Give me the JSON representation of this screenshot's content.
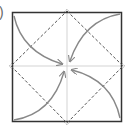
{
  "diagram": {
    "type": "origami-fold",
    "step_mark": ")",
    "colors": {
      "square": "#333333",
      "dashed": "#555555",
      "crease": "#bbbbbb",
      "arrow": "#888888"
    },
    "elements": [
      {
        "kind": "square",
        "label": "paper square"
      },
      {
        "kind": "valley-fold-diamond",
        "label": "dashed diamond connecting side midpoints"
      },
      {
        "kind": "crease",
        "label": "horizontal center crease"
      },
      {
        "kind": "crease",
        "label": "vertical center crease"
      },
      {
        "kind": "arrow",
        "label": "fold top-left corner to center"
      },
      {
        "kind": "arrow",
        "label": "fold top-right corner to center"
      },
      {
        "kind": "arrow",
        "label": "fold bottom-left corner to center"
      },
      {
        "kind": "arrow",
        "label": "fold bottom-right corner to center"
      }
    ]
  }
}
